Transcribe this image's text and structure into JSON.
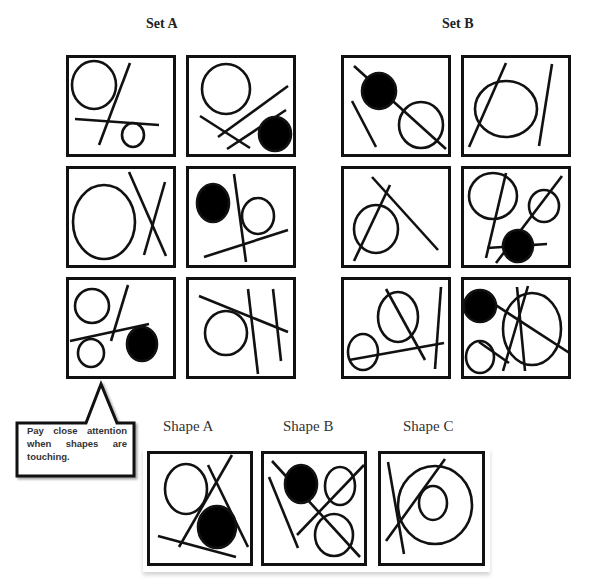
{
  "header": {
    "set_a_title": "Set A",
    "set_b_title": "Set B"
  },
  "callout": {
    "text": "Pay close attention when shapes are touching."
  },
  "options": {
    "shape_a_label": "Shape A",
    "shape_b_label": "Shape B",
    "shape_c_label": "Shape C"
  },
  "colors": {
    "stroke": "#111111",
    "fill": "#000000",
    "background": "#ffffff"
  },
  "panels": {
    "set_a": [
      {
        "id": "A1",
        "x": 66,
        "y": 55,
        "w": 110,
        "h": 102,
        "circles": [
          {
            "cx": 28,
            "cy": 30,
            "rx": 22,
            "ry": 24,
            "fill": false
          },
          {
            "cx": 67,
            "cy": 80,
            "rx": 11,
            "ry": 12,
            "fill": false
          }
        ],
        "lines": [
          [
            9,
            64,
            93,
            70
          ],
          [
            64,
            8,
            33,
            90
          ]
        ]
      },
      {
        "id": "A2",
        "x": 186,
        "y": 55,
        "w": 110,
        "h": 102,
        "circles": [
          {
            "cx": 40,
            "cy": 34,
            "rx": 24,
            "ry": 25,
            "fill": false
          },
          {
            "cx": 89,
            "cy": 79,
            "rx": 16,
            "ry": 17,
            "fill": false,
            "solid": true
          }
        ],
        "lines": [
          [
            14,
            61,
            64,
            93
          ],
          [
            32,
            82,
            102,
            31
          ],
          [
            41,
            94,
            100,
            55
          ]
        ]
      },
      {
        "id": "A3",
        "x": 66,
        "y": 166,
        "w": 110,
        "h": 102,
        "circles": [
          {
            "cx": 38,
            "cy": 56,
            "rx": 31,
            "ry": 37,
            "fill": false
          }
        ],
        "lines": [
          [
            63,
            6,
            100,
            90
          ],
          [
            99,
            16,
            78,
            89
          ]
        ]
      },
      {
        "id": "A4",
        "x": 186,
        "y": 166,
        "w": 110,
        "h": 102,
        "circles": [
          {
            "cx": 27,
            "cy": 37,
            "rx": 16,
            "ry": 19,
            "fill": true
          },
          {
            "cx": 72,
            "cy": 50,
            "rx": 16,
            "ry": 18,
            "fill": false
          }
        ],
        "lines": [
          [
            48,
            8,
            60,
            96
          ],
          [
            18,
            91,
            102,
            64
          ]
        ]
      },
      {
        "id": "A5",
        "x": 66,
        "y": 277,
        "w": 110,
        "h": 102,
        "circles": [
          {
            "cx": 26,
            "cy": 29,
            "rx": 17,
            "ry": 17,
            "fill": false
          },
          {
            "cx": 25,
            "cy": 76,
            "rx": 13,
            "ry": 14,
            "fill": false
          },
          {
            "cx": 76,
            "cy": 67,
            "rx": 15,
            "ry": 17,
            "fill": true
          }
        ],
        "lines": [
          [
            4,
            64,
            83,
            47
          ],
          [
            62,
            8,
            45,
            64
          ]
        ]
      },
      {
        "id": "A6",
        "x": 186,
        "y": 277,
        "w": 110,
        "h": 102,
        "circles": [
          {
            "cx": 40,
            "cy": 56,
            "rx": 21,
            "ry": 22,
            "fill": false
          }
        ],
        "lines": [
          [
            13,
            19,
            102,
            55
          ],
          [
            62,
            12,
            72,
            97
          ],
          [
            87,
            12,
            95,
            84
          ]
        ]
      }
    ],
    "set_b": [
      {
        "id": "B1",
        "x": 341,
        "y": 55,
        "w": 110,
        "h": 102,
        "circles": [
          {
            "cx": 38,
            "cy": 36,
            "rx": 17,
            "ry": 18,
            "fill": true
          },
          {
            "cx": 80,
            "cy": 70,
            "rx": 22,
            "ry": 23,
            "fill": false
          }
        ],
        "lines": [
          [
            13,
            11,
            105,
            94
          ],
          [
            11,
            46,
            35,
            92
          ]
        ]
      },
      {
        "id": "B2",
        "x": 461,
        "y": 55,
        "w": 110,
        "h": 102,
        "circles": [
          {
            "cx": 45,
            "cy": 54,
            "rx": 31,
            "ry": 28,
            "fill": false
          }
        ],
        "lines": [
          [
            45,
            8,
            8,
            92
          ],
          [
            91,
            9,
            78,
            91
          ]
        ]
      },
      {
        "id": "B3",
        "x": 341,
        "y": 166,
        "w": 110,
        "h": 102,
        "circles": [
          {
            "cx": 35,
            "cy": 63,
            "rx": 22,
            "ry": 24,
            "fill": false
          }
        ],
        "lines": [
          [
            49,
            19,
            13,
            95
          ],
          [
            31,
            11,
            97,
            84
          ]
        ]
      },
      {
        "id": "B4",
        "x": 461,
        "y": 166,
        "w": 110,
        "h": 102,
        "circles": [
          {
            "cx": 32,
            "cy": 30,
            "rx": 24,
            "ry": 23,
            "fill": false
          },
          {
            "cx": 83,
            "cy": 40,
            "rx": 15,
            "ry": 16,
            "fill": false
          },
          {
            "cx": 57,
            "cy": 80,
            "rx": 15,
            "ry": 16,
            "fill": true
          }
        ],
        "lines": [
          [
            45,
            7,
            25,
            92
          ],
          [
            101,
            10,
            35,
            97
          ],
          [
            26,
            82,
            86,
            78
          ]
        ]
      },
      {
        "id": "B5",
        "x": 341,
        "y": 277,
        "w": 110,
        "h": 102,
        "circles": [
          {
            "cx": 57,
            "cy": 40,
            "rx": 20,
            "ry": 25,
            "fill": false
          },
          {
            "cx": 22,
            "cy": 75,
            "rx": 15,
            "ry": 18,
            "fill": false
          }
        ],
        "lines": [
          [
            45,
            12,
            84,
            83
          ],
          [
            100,
            10,
            94,
            92
          ],
          [
            8,
            83,
            103,
            66
          ]
        ]
      },
      {
        "id": "B6",
        "x": 461,
        "y": 277,
        "w": 110,
        "h": 102,
        "circles": [
          {
            "cx": 19,
            "cy": 29,
            "rx": 16,
            "ry": 16,
            "fill": true
          },
          {
            "cx": 71,
            "cy": 52,
            "rx": 29,
            "ry": 36,
            "fill": false
          },
          {
            "cx": 19,
            "cy": 80,
            "rx": 14,
            "ry": 16,
            "fill": false
          }
        ],
        "lines": [
          [
            13,
            14,
            110,
            77
          ],
          [
            56,
            10,
            64,
            94
          ],
          [
            67,
            9,
            42,
            94
          ],
          [
            18,
            65,
            48,
            86
          ]
        ]
      }
    ],
    "options": [
      {
        "id": "SA",
        "x": 147,
        "y": 451,
        "w": 106,
        "h": 115,
        "circles": [
          {
            "cx": 39,
            "cy": 38,
            "rx": 21,
            "ry": 25,
            "fill": false
          },
          {
            "cx": 70,
            "cy": 76,
            "rx": 19,
            "ry": 21,
            "fill": true
          }
        ],
        "lines": [
          [
            85,
            4,
            32,
            96
          ],
          [
            61,
            14,
            101,
            96
          ],
          [
            11,
            85,
            89,
            106
          ]
        ]
      },
      {
        "id": "SB",
        "x": 261,
        "y": 451,
        "w": 106,
        "h": 115,
        "circles": [
          {
            "cx": 40,
            "cy": 33,
            "rx": 16,
            "ry": 19,
            "fill": true
          },
          {
            "cx": 79,
            "cy": 35,
            "rx": 15,
            "ry": 19,
            "fill": false
          },
          {
            "cx": 73,
            "cy": 84,
            "rx": 19,
            "ry": 21,
            "fill": false
          }
        ],
        "lines": [
          [
            11,
            10,
            99,
            106
          ],
          [
            103,
            14,
            36,
            84
          ],
          [
            8,
            26,
            37,
            97
          ]
        ]
      },
      {
        "id": "SC",
        "x": 378,
        "y": 451,
        "w": 107,
        "h": 115,
        "circles": [
          {
            "cx": 57,
            "cy": 54,
            "rx": 37,
            "ry": 39,
            "fill": false
          },
          {
            "cx": 55,
            "cy": 52,
            "rx": 14,
            "ry": 17,
            "fill": false
          }
        ],
        "lines": [
          [
            67,
            8,
            8,
            90
          ],
          [
            10,
            11,
            26,
            103
          ]
        ]
      }
    ]
  }
}
